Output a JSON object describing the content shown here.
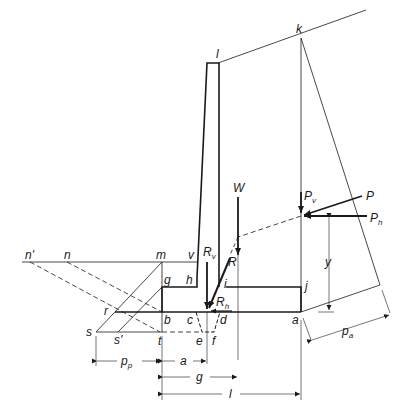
{
  "diagram": {
    "points": {
      "l": "l",
      "k": "k",
      "v": "v",
      "m": "m",
      "n": "n",
      "n_prime": "n'",
      "g": "g",
      "h": "h",
      "i": "i",
      "j": "j",
      "r": "r",
      "b": "b",
      "c": "c",
      "d": "d",
      "a": "a",
      "s": "s",
      "s_prime": "s'",
      "t": "t",
      "e": "e",
      "f": "f"
    },
    "forces": {
      "W": "W",
      "R": "R",
      "Rv": {
        "main": "R",
        "sub": "v"
      },
      "Rh": {
        "main": "R",
        "sub": "h"
      },
      "P": "P",
      "Pv": {
        "main": "P",
        "sub": "v"
      },
      "Ph": {
        "main": "P",
        "sub": "h"
      }
    },
    "dimensions": {
      "pp": {
        "main": "p",
        "sub": "p"
      },
      "a": "a",
      "g": "g",
      "l": "l",
      "y": "y",
      "pa": {
        "main": "p",
        "sub": "a"
      }
    },
    "colors": {
      "line": "#1a1a1a",
      "background": "#ffffff"
    }
  }
}
